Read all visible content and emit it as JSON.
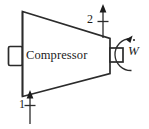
{
  "figure": {
    "name": "compressor-schematic",
    "type": "thermodynamic-device-diagram",
    "device_label": "Compressor",
    "background_color": "#ffffff",
    "line_color": "#2b2b2b",
    "states": [
      {
        "id": "1",
        "label": "1",
        "position": "bottom-left",
        "flow_direction": "into-device",
        "arrow_direction": "up",
        "role": "inlet"
      },
      {
        "id": "2",
        "label": "2",
        "position": "top-right",
        "flow_direction": "out-of-device",
        "arrow_direction": "up",
        "role": "outlet"
      }
    ],
    "work": {
      "symbol": "W",
      "has_overdot": true,
      "label": "W",
      "meaning": "shaft work rate",
      "position": "right",
      "rotation_arrow": "counterclockwise"
    },
    "parts": {
      "inlet_flange_label": "inlet-flange",
      "shaft_label": "drive-shaft",
      "housing_label": "compressor-housing"
    }
  }
}
